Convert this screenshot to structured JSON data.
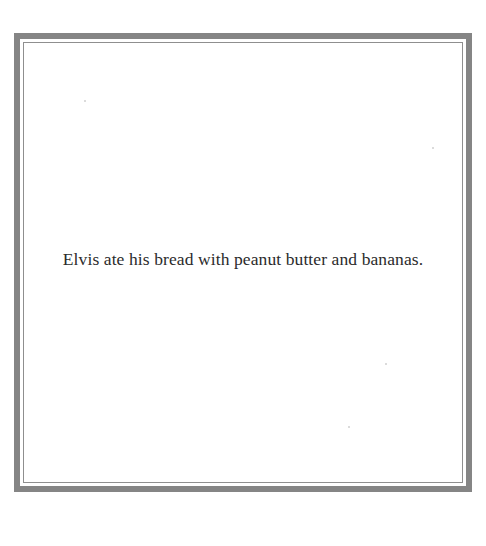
{
  "card": {
    "caption": "Elvis ate his bread with peanut butter and bananas.",
    "border_color": "#858585",
    "background_color": "#ffffff"
  }
}
